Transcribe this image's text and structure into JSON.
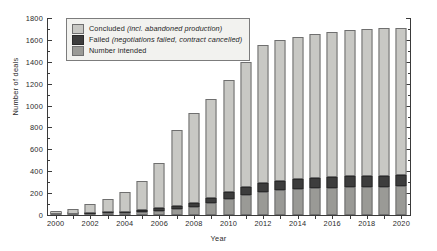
{
  "chart_data": {
    "type": "bar",
    "title": "",
    "xlabel": "Year",
    "ylabel": "Number of deals",
    "ylim": [
      0,
      1800
    ],
    "ytick_step": 200,
    "yminor_step": 100,
    "grid": false,
    "stacked": true,
    "legend_position": "top-left",
    "categories": [
      "2000",
      "2001",
      "2002",
      "2003",
      "2004",
      "2005",
      "2006",
      "2007",
      "2008",
      "2009",
      "2010",
      "2011",
      "2012",
      "2013",
      "2014",
      "2015",
      "2016",
      "2017",
      "2018",
      "2019",
      "2020"
    ],
    "xtick_labels": [
      "2000",
      "2002",
      "2004",
      "2006",
      "2008",
      "2010",
      "2012",
      "2014",
      "2016",
      "2018",
      "2020"
    ],
    "ytick_labels": [
      "0",
      "200",
      "400",
      "600",
      "800",
      "1000",
      "1200",
      "1400",
      "1600",
      "1800"
    ],
    "series": [
      {
        "name": "Number intended",
        "key": "intended",
        "color": "#9a9a96",
        "values": [
          5,
          8,
          12,
          16,
          20,
          28,
          40,
          55,
          75,
          110,
          150,
          185,
          210,
          225,
          235,
          245,
          250,
          255,
          258,
          260,
          262
        ]
      },
      {
        "name": "Failed",
        "key": "failed",
        "color": "#3d3d3d",
        "values": [
          2,
          3,
          5,
          7,
          10,
          14,
          20,
          28,
          38,
          50,
          62,
          72,
          80,
          86,
          90,
          94,
          96,
          98,
          100,
          101,
          102
        ]
      },
      {
        "name": "Concluded",
        "key": "concluded",
        "color": "#c8c8c4",
        "values": [
          28,
          44,
          88,
          127,
          180,
          268,
          418,
          690,
          820,
          900,
          1018,
          1143,
          1268,
          1288,
          1300,
          1316,
          1324,
          1337,
          1342,
          1344,
          1346
        ]
      }
    ],
    "totals": [
      35,
      55,
      105,
      150,
      210,
      310,
      478,
      773,
      933,
      1060,
      1230,
      1400,
      1558,
      1599,
      1625,
      1655,
      1670,
      1690,
      1700,
      1705,
      1710
    ],
    "legend": [
      {
        "swatch": "concluded",
        "label": "Concluded",
        "note": "(incl. abandoned production)"
      },
      {
        "swatch": "failed",
        "label": "Failed",
        "note": "(negotiations failed, contract cancelled)"
      },
      {
        "swatch": "intended",
        "label": "Number intended",
        "note": ""
      }
    ]
  }
}
